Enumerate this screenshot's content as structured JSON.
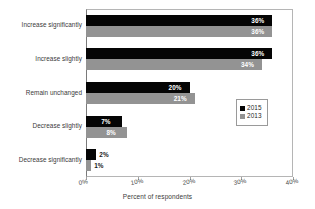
{
  "chart_data": {
    "type": "bar",
    "orientation": "horizontal",
    "title": "",
    "xlabel": "Percent of respondents",
    "ylabel": "",
    "xlim": [
      0,
      40
    ],
    "xticks": [
      "0%",
      "10%",
      "20%",
      "30%",
      "40%"
    ],
    "grid": false,
    "legend_position": "middle-right",
    "categories": [
      "Increase significantly",
      "Increase slightly",
      "Remain unchanged",
      "Decrease slightly",
      "Decrease significantly"
    ],
    "series": [
      {
        "name": "2015",
        "color": "#050505",
        "values": [
          36,
          36,
          20,
          7,
          2
        ],
        "labels": [
          "36%",
          "36%",
          "20%",
          "7%",
          "2%"
        ]
      },
      {
        "name": "2013",
        "color": "#939393",
        "values": [
          36,
          34,
          21,
          8,
          1
        ],
        "labels": [
          "36%",
          "34%",
          "21%",
          "8%",
          "1%"
        ]
      }
    ]
  },
  "legend": {
    "items": [
      {
        "label": "2015",
        "color": "#050505"
      },
      {
        "label": "2013",
        "color": "#939393"
      }
    ]
  }
}
